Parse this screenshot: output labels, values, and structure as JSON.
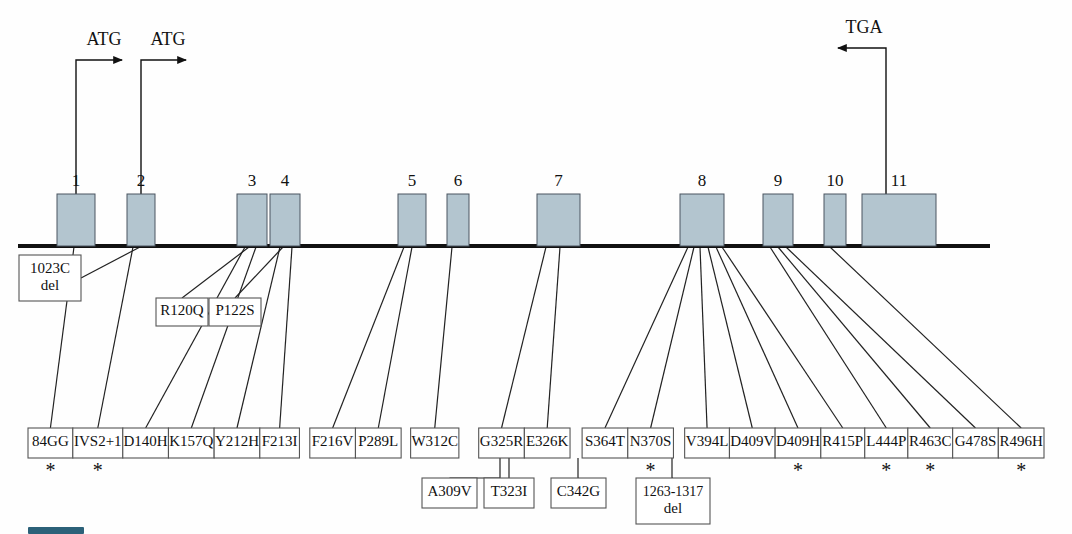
{
  "figure": {
    "exon_fill_color": "#b3c5cf",
    "exon_stroke_color": "#4a5560",
    "backbone_color": "#111111",
    "box_stroke_color": "#555555",
    "caption_swatch_color": "#2c6179"
  },
  "backbone": {
    "x_start": 18,
    "x_end": 990,
    "y": 246
  },
  "exons": [
    {
      "number": "1",
      "x": 57,
      "width": 38,
      "height": 52
    },
    {
      "number": "2",
      "x": 127,
      "width": 28,
      "height": 52
    },
    {
      "number": "3",
      "x": 237,
      "width": 30,
      "height": 52
    },
    {
      "number": "4",
      "x": 270,
      "width": 30,
      "height": 52
    },
    {
      "number": "5",
      "x": 398,
      "width": 28,
      "height": 52
    },
    {
      "number": "6",
      "x": 447,
      "width": 22,
      "height": 52
    },
    {
      "number": "7",
      "x": 537,
      "width": 43,
      "height": 52
    },
    {
      "number": "8",
      "x": 680,
      "width": 44,
      "height": 52
    },
    {
      "number": "9",
      "x": 763,
      "width": 30,
      "height": 52
    },
    {
      "number": "10",
      "x": 824,
      "width": 22,
      "height": 52
    },
    {
      "number": "11",
      "x": 862,
      "width": 74,
      "height": 52
    }
  ],
  "codon_markers": [
    {
      "label": "ATG",
      "name": "atg-start-codon-1",
      "direction": "right",
      "stem_x": 76,
      "stem_top_y": 60,
      "arrow_x": 122,
      "label_x": 104,
      "label_y": 45
    },
    {
      "label": "ATG",
      "name": "atg-start-codon-2",
      "direction": "right",
      "stem_x": 141,
      "stem_top_y": 60,
      "arrow_x": 186,
      "label_x": 168,
      "label_y": 45
    },
    {
      "label": "TGA",
      "name": "tga-stop-codon",
      "direction": "left",
      "stem_x": 886,
      "stem_top_y": 48,
      "arrow_x": 838,
      "label_x": 864,
      "label_y": 33
    }
  ],
  "mutation_rows": {
    "row1_y": 428,
    "row1_height": 30,
    "row2_y": 478,
    "row2_height": 30,
    "row2_tall_height": 46,
    "upper_y": 297,
    "upper_height": 30,
    "upper_tall_y": 255,
    "upper_tall_height": 46
  },
  "mutations_upper": [
    {
      "label": "1023C del",
      "lines": [
        "1023C",
        "del"
      ],
      "x": 19,
      "width": 62,
      "y": 255,
      "height": 46,
      "exon_anchor_x": 140,
      "star": false
    },
    {
      "label": "R120Q",
      "lines": [
        "R120Q"
      ],
      "x": 156,
      "width": 52,
      "y": 298,
      "height": 28,
      "exon_anchor_x": 249,
      "star": false
    },
    {
      "label": "P122S",
      "lines": [
        "P122S"
      ],
      "x": 209,
      "width": 52,
      "y": 298,
      "height": 28,
      "exon_anchor_x": 283,
      "star": false
    }
  ],
  "mutations_row1": [
    {
      "label": "84GG",
      "x": 28,
      "width": 52,
      "exon_anchor_x": 74,
      "star": true
    },
    {
      "label": "IVS2+1",
      "x": 80,
      "width": 58,
      "exon_anchor_x": 133,
      "star": true
    },
    {
      "label": "D140H",
      "x": 138,
      "width": 53,
      "exon_anchor_x": 245,
      "star": false
    },
    {
      "label": "K157Q",
      "x": 191,
      "width": 53,
      "exon_anchor_x": 256,
      "star": false
    },
    {
      "label": "Y212H",
      "x": 244,
      "width": 53,
      "exon_anchor_x": 280,
      "star": false
    },
    {
      "label": "F213I",
      "x": 297,
      "width": 46,
      "exon_anchor_x": 292,
      "star": false
    },
    {
      "label": "F216V",
      "x": 355,
      "width": 53,
      "exon_anchor_x": 404,
      "star": false
    },
    {
      "label": "P289L",
      "x": 408,
      "width": 53,
      "exon_anchor_x": 412,
      "star": false
    },
    {
      "label": "W312C",
      "x": 472,
      "width": 56,
      "exon_anchor_x": 452,
      "star": false
    },
    {
      "label": "G325R",
      "x": 551,
      "width": 53,
      "exon_anchor_x": 546,
      "star": false
    },
    {
      "label": "E326K",
      "x": 604,
      "width": 53,
      "exon_anchor_x": 560,
      "star": false
    },
    {
      "label": "S364T",
      "x": 671,
      "width": 53,
      "exon_anchor_x": 688,
      "star": false
    },
    {
      "label": "N370S",
      "x": 724,
      "width": 53,
      "exon_anchor_x": 694,
      "star": true
    },
    {
      "label": "V394L",
      "x": 790,
      "width": 52,
      "exon_anchor_x": 700,
      "star": false
    },
    {
      "label": "D409V",
      "x": 842,
      "width": 53,
      "exon_anchor_x": 708,
      "star": false
    },
    {
      "label": "D409H",
      "x": 895,
      "width": 53,
      "exon_anchor_x": 716,
      "star": true
    },
    {
      "label": "R415P",
      "x": 948,
      "width": 51,
      "exon_anchor_x": 722,
      "star": false
    },
    {
      "label": "L444P",
      "x": 999,
      "width": 50,
      "exon_anchor_x": 770,
      "star": true
    },
    {
      "label": "R463C",
      "x": 1049,
      "width": 52,
      "exon_anchor_x": 778,
      "star": true
    },
    {
      "label": "G478S",
      "x": 1101,
      "width": 53,
      "exon_anchor_x": 786,
      "star": false
    },
    {
      "label": "R496H",
      "x": 1154,
      "width": 53,
      "exon_anchor_x": 830,
      "star": true
    }
  ],
  "mutations_row2": [
    {
      "label": "A309V",
      "lines": [
        "A309V"
      ],
      "x": 422,
      "width": 55,
      "y": 478,
      "height": 30,
      "stem_from_x": 500,
      "star": false
    },
    {
      "label": "T323I",
      "lines": [
        "T323I"
      ],
      "x": 484,
      "width": 50,
      "y": 478,
      "height": 30,
      "stem_from_x": 509,
      "star": false
    },
    {
      "label": "C342G",
      "lines": [
        "C342G"
      ],
      "x": 551,
      "width": 55,
      "y": 478,
      "height": 30,
      "stem_from_x": 578,
      "star": false
    },
    {
      "label": "1263-1317 del",
      "lines": [
        "1263-1317",
        "del"
      ],
      "x": 636,
      "width": 74,
      "y": 478,
      "height": 46,
      "stem_from_x": 672,
      "star": false
    }
  ],
  "caption": {
    "swatch_label": "",
    "ghost_text": ""
  }
}
